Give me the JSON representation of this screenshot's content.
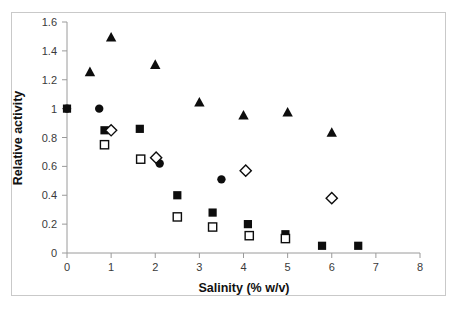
{
  "figure": {
    "background_color": "#ffffff",
    "frame_color": "#c9c9c9"
  },
  "chart_data": {
    "type": "scatter",
    "title": "",
    "xlabel": "Salinity (% w/v)",
    "ylabel": "Relative activity",
    "xlim": [
      0,
      8
    ],
    "ylim": [
      0,
      1.6
    ],
    "xticks": [
      0,
      1,
      2,
      3,
      4,
      5,
      6,
      7,
      8
    ],
    "xtick_labels": [
      "0",
      "1",
      "2",
      "3",
      "4",
      "5",
      "6",
      "7",
      "8"
    ],
    "yticks": [
      0,
      0.2,
      0.4,
      0.6,
      0.8,
      1,
      1.2,
      1.4,
      1.6
    ],
    "ytick_labels": [
      "0",
      "0.2",
      "0.4",
      "0.6",
      "0.8",
      "1",
      "1.2",
      "1.4",
      "1.6"
    ],
    "grid": false,
    "legend": "none",
    "marker_color": "#0d0d0d",
    "series": [
      {
        "name": "filled-triangle",
        "marker": "triangle",
        "fill": "filled",
        "points": [
          {
            "x": 0.52,
            "y": 1.25
          },
          {
            "x": 1.0,
            "y": 1.49
          },
          {
            "x": 2.0,
            "y": 1.3
          },
          {
            "x": 3.0,
            "y": 1.04
          },
          {
            "x": 4.0,
            "y": 0.95
          },
          {
            "x": 5.0,
            "y": 0.97
          },
          {
            "x": 6.0,
            "y": 0.83
          }
        ]
      },
      {
        "name": "filled-circle",
        "marker": "circle",
        "fill": "filled",
        "points": [
          {
            "x": 0.0,
            "y": 1.0
          },
          {
            "x": 0.73,
            "y": 1.0
          },
          {
            "x": 2.1,
            "y": 0.62
          },
          {
            "x": 3.5,
            "y": 0.51
          }
        ]
      },
      {
        "name": "filled-square",
        "marker": "square",
        "fill": "filled",
        "points": [
          {
            "x": 0.0,
            "y": 1.0
          },
          {
            "x": 0.85,
            "y": 0.85
          },
          {
            "x": 1.65,
            "y": 0.86
          },
          {
            "x": 2.5,
            "y": 0.4
          },
          {
            "x": 3.3,
            "y": 0.28
          },
          {
            "x": 4.1,
            "y": 0.2
          },
          {
            "x": 4.95,
            "y": 0.13
          },
          {
            "x": 5.78,
            "y": 0.05
          },
          {
            "x": 6.6,
            "y": 0.05
          }
        ]
      },
      {
        "name": "open-square",
        "marker": "square",
        "fill": "open",
        "points": [
          {
            "x": 0.85,
            "y": 0.75
          },
          {
            "x": 1.67,
            "y": 0.65
          },
          {
            "x": 2.5,
            "y": 0.25
          },
          {
            "x": 3.3,
            "y": 0.18
          },
          {
            "x": 4.13,
            "y": 0.12
          },
          {
            "x": 4.95,
            "y": 0.1
          }
        ]
      },
      {
        "name": "open-diamond",
        "marker": "diamond",
        "fill": "open",
        "points": [
          {
            "x": 1.0,
            "y": 0.85
          },
          {
            "x": 2.02,
            "y": 0.66
          },
          {
            "x": 4.05,
            "y": 0.57
          },
          {
            "x": 6.0,
            "y": 0.38
          }
        ]
      }
    ]
  }
}
